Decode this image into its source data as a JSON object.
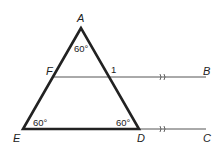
{
  "diagram": {
    "type": "geometry",
    "points": {
      "A": {
        "label": "A",
        "x": 81,
        "y": 28
      },
      "E": {
        "label": "E",
        "x": 23,
        "y": 129
      },
      "D": {
        "label": "D",
        "x": 139,
        "y": 129
      },
      "F": {
        "label": "F",
        "x": 54,
        "y": 77
      },
      "B": {
        "label": "B",
        "x": 206,
        "y": 77
      },
      "C": {
        "label": "C",
        "x": 206,
        "y": 129
      }
    },
    "angle_labels": {
      "A": "60°",
      "E": "60°",
      "D": "60°",
      "one": "1"
    },
    "parallel_marks": ">>",
    "colors": {
      "stroke": "#222222",
      "thin_stroke": "#555555"
    }
  }
}
